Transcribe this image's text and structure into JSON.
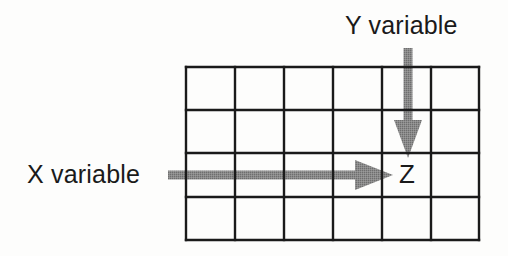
{
  "diagram": {
    "background_color": "#fdfdfc",
    "grid": {
      "columns": 6,
      "rows": 4,
      "line_color": "#1a1a1a",
      "line_width": 2,
      "bounds": {
        "x": 186,
        "y": 67,
        "width": 293,
        "height": 173
      },
      "cells": [
        [
          "",
          "",
          "",
          "",
          "",
          ""
        ],
        [
          "",
          "",
          "",
          "",
          "",
          ""
        ],
        [
          "",
          "",
          "",
          "",
          "Z",
          ""
        ],
        [
          "",
          "",
          "",
          "",
          "",
          ""
        ]
      ]
    },
    "labels": {
      "y_variable": "Y variable",
      "x_variable": "X variable",
      "cell_value": "Z"
    },
    "arrows": [
      {
        "name": "y-variable-arrow",
        "label": "Y variable",
        "direction": "down",
        "color": "#808080",
        "shaft_x": 408,
        "start_y": 48,
        "head_tip_y": 158,
        "head_top_y": 120,
        "head_half_width": 14,
        "shaft_width": 9
      },
      {
        "name": "x-variable-arrow",
        "label": "X variable",
        "direction": "right",
        "color": "#808080",
        "shaft_y": 175,
        "start_x": 168,
        "head_tip_x": 393,
        "head_back_x": 355,
        "head_half_height": 15,
        "shaft_width": 9
      }
    ],
    "target_cell": {
      "column": 5,
      "row": 3,
      "value": "Z"
    },
    "colors": {
      "ink": "#1a1a1a",
      "arrow_gray": "#808080",
      "paper": "#fdfdfc"
    }
  }
}
